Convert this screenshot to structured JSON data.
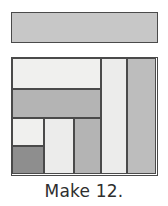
{
  "figure": {
    "caption": "Make 12.",
    "background_color": "#ffffff",
    "outline_color": "#4a4a4a",
    "fabrics": {
      "light": "#f0f0ee",
      "light_alt": "#ececeb",
      "medium": "#b4b4b4",
      "medium_alt": "#bdbdbd",
      "dark": "#8e8e8e",
      "bar": "#c7c7c7"
    },
    "strip_bar": {
      "label": "fabric strip",
      "fill": "#c7c7c7"
    },
    "block": {
      "label": "pieced block",
      "patches": [
        {
          "name": "top-left-light-rectangle",
          "fill": "#f0f0ee",
          "x": 0,
          "y": 0,
          "w": 89,
          "h": 31
        },
        {
          "name": "mid-left-medium-rectangle",
          "fill": "#b4b4b4",
          "x": 0,
          "y": 31,
          "w": 89,
          "h": 29
        },
        {
          "name": "lower-left-light-square",
          "fill": "#f0f0ee",
          "x": 0,
          "y": 60,
          "w": 32,
          "h": 28
        },
        {
          "name": "lower-left-dark-square",
          "fill": "#8e8e8e",
          "x": 0,
          "y": 88,
          "w": 32,
          "h": 28
        },
        {
          "name": "lower-center-light-rectangle",
          "fill": "#ececeb",
          "x": 32,
          "y": 60,
          "w": 30,
          "h": 56
        },
        {
          "name": "lower-right-medium-rectangle",
          "fill": "#b4b4b4",
          "x": 62,
          "y": 60,
          "w": 27,
          "h": 56
        },
        {
          "name": "tall-light-strip",
          "fill": "#ececeb",
          "x": 89,
          "y": 0,
          "w": 26,
          "h": 116
        },
        {
          "name": "tall-medium-strip",
          "fill": "#bdbdbd",
          "x": 115,
          "y": 0,
          "w": 29,
          "h": 116
        }
      ]
    }
  }
}
